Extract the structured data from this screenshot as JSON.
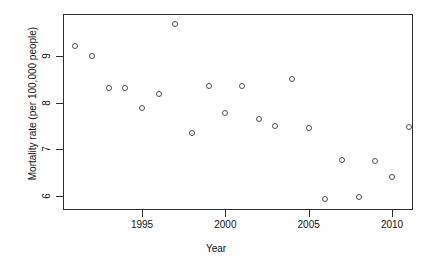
{
  "chart_data": {
    "type": "scatter",
    "title": "",
    "xlabel": "Year",
    "ylabel": "Mortality rate (per 100,000 people)",
    "xlim": [
      1990.2,
      1991.8
    ],
    "ylim": [
      5.75,
      9.85
    ],
    "grid": false,
    "legend": null,
    "xticks": [
      1995,
      2000,
      2005,
      2010
    ],
    "xtick_labels": [
      "1995",
      "2000",
      "2005",
      "2010"
    ],
    "yticks": [
      6,
      7,
      8,
      9
    ],
    "ytick_labels": [
      "6",
      "7",
      "8",
      "9"
    ],
    "marker": "open-circle",
    "marker_color": "#4b4b4b",
    "x": [
      1991,
      1992,
      1993,
      1994,
      1995,
      1996,
      1997,
      1998,
      1999,
      2000,
      2001,
      2002,
      2003,
      2004,
      2005,
      2006,
      2007,
      2008,
      2009,
      2010,
      2011
    ],
    "y": [
      9.22,
      9.0,
      8.32,
      8.31,
      7.88,
      8.19,
      9.68,
      7.36,
      8.35,
      7.78,
      8.35,
      7.64,
      7.51,
      8.5,
      7.45,
      5.94,
      6.78,
      5.98,
      6.75,
      6.41,
      7.47
    ],
    "points": [
      {
        "year": 1991,
        "rate": 9.22
      },
      {
        "year": 1992,
        "rate": 9.0
      },
      {
        "year": 1993,
        "rate": 8.32
      },
      {
        "year": 1994,
        "rate": 8.31
      },
      {
        "year": 1995,
        "rate": 7.88
      },
      {
        "year": 1996,
        "rate": 8.19
      },
      {
        "year": 1997,
        "rate": 9.68
      },
      {
        "year": 1998,
        "rate": 7.36
      },
      {
        "year": 1999,
        "rate": 8.35
      },
      {
        "year": 2000,
        "rate": 7.78
      },
      {
        "year": 2001,
        "rate": 8.35
      },
      {
        "year": 2002,
        "rate": 7.64
      },
      {
        "year": 2003,
        "rate": 7.51
      },
      {
        "year": 2004,
        "rate": 8.5
      },
      {
        "year": 2005,
        "rate": 7.45
      },
      {
        "year": 2006,
        "rate": 5.94
      },
      {
        "year": 2007,
        "rate": 6.78
      },
      {
        "year": 2008,
        "rate": 5.98
      },
      {
        "year": 2009,
        "rate": 6.75
      },
      {
        "year": 2010,
        "rate": 6.41
      },
      {
        "year": 2011,
        "rate": 7.47
      }
    ]
  },
  "axes": {
    "x_label": "Year",
    "y_label": "Mortality rate (per 100,000 people)"
  }
}
